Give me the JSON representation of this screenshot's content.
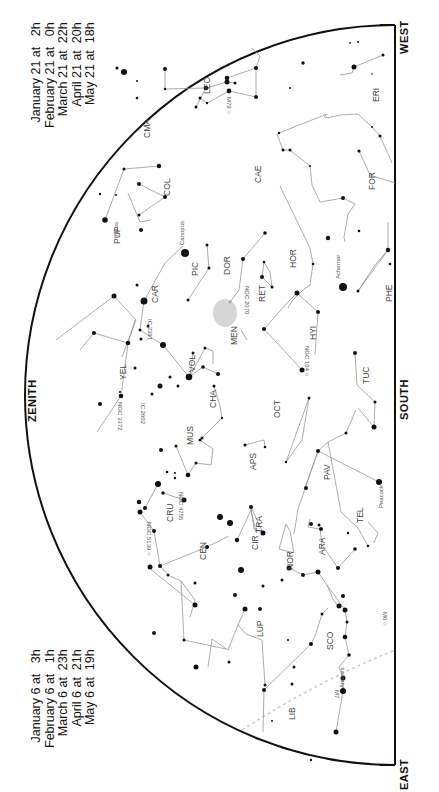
{
  "chart": {
    "directions": {
      "zenith": "ZENITH",
      "south": "SOUTH",
      "west": "WEST",
      "east": "EAST"
    },
    "times_west": [
      "January 21 at   2h",
      "February 21 at   0h",
      "March 21 at  22h",
      "April 21 at  20h",
      "May 21 at  18h"
    ],
    "times_east": [
      "January 6 at   3h",
      "February 6 at   1h",
      "March 6 at  23h",
      "April 6 at  21h",
      "May 6 at  19h"
    ],
    "constellations": [
      "LEO",
      "CMA",
      "ERI",
      "COL",
      "CAE",
      "FOR",
      "PUP",
      "CAR",
      "PIC",
      "DOR",
      "HOR",
      "RET",
      "PHE",
      "VEL",
      "VOL",
      "MEN",
      "HYI",
      "TUC",
      "CHA",
      "OCT",
      "MUS",
      "APS",
      "PAV",
      "CRU",
      "TRA",
      "TEL",
      "CEN",
      "CIR",
      "NOR",
      "ARA",
      "LUP",
      "SCO",
      "LIB"
    ],
    "stars": [
      "Canopus",
      "Naos",
      "Achernar",
      "Peacock",
      "Antares"
    ],
    "deep_sky": [
      "M79",
      "NGC 2070",
      "NGC 104",
      "NGC 2516",
      "IC 2391",
      "NGC 3372",
      "IC 2602",
      "NGC 4755",
      "NGC 5139",
      "M6",
      "M7"
    ]
  }
}
